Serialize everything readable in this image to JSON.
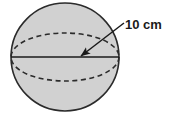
{
  "figure": {
    "name": "sphere-radius-diagram",
    "canvas": {
      "width": 171,
      "height": 115,
      "background": "#ffffff"
    },
    "sphere": {
      "label": "sphere",
      "center_x": 65,
      "center_y": 57,
      "radius": 54,
      "fill": "#d1d1d1",
      "stroke": "#2b2b2b",
      "stroke_width": 1.6
    },
    "equator": {
      "label": "equator-ellipse",
      "center_x": 65,
      "center_y": 57,
      "rx": 54,
      "ry": 24,
      "stroke": "#2b2b2b",
      "stroke_width": 1.6,
      "dash": "5 3.5"
    },
    "diameter_line": {
      "label": "diameter-line",
      "x1": 11,
      "y1": 57,
      "x2": 119,
      "y2": 57,
      "stroke": "#1a1a1a",
      "stroke_width": 1.6
    },
    "leader": {
      "label": "radius-leader-arrow",
      "x1": 124,
      "y1": 23,
      "x2": 81,
      "y2": 56,
      "stroke": "#1a1a1a",
      "stroke_width": 1.5,
      "arrow_size": 7
    },
    "measurement": {
      "label_text": "10 cm",
      "value": 10,
      "unit": "cm",
      "quantity": "radius",
      "text_x": 125,
      "text_y": 29,
      "color": "#1a1a1a",
      "font_size": 13
    }
  }
}
